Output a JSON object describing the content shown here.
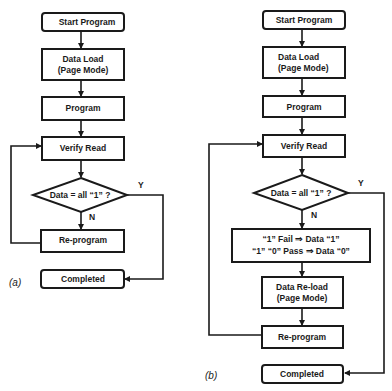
{
  "diagram": {
    "type": "flowchart",
    "panels": [
      {
        "label": "(a)",
        "nodes": {
          "start": "Start Program",
          "data_load_1": "Data Load",
          "data_load_2": "(Page Mode)",
          "program": "Program",
          "verify": "Verify Read",
          "decision": "Data = all “1” ?",
          "reprogram": "Re-program",
          "completed": "Completed"
        },
        "edges": {
          "yes": "Y",
          "no": "N"
        }
      },
      {
        "label": "(b)",
        "nodes": {
          "start": "Start Program",
          "data_load_1": "Data Load",
          "data_load_2": "(Page Mode)",
          "program": "Program",
          "verify": "Verify Read",
          "decision": "Data = all “1” ?",
          "rule_1": "“1” Fail ⇒ Data “1”",
          "rule_2": "“1” “0” Pass ⇒ Data “0”",
          "reload_1": "Data Re-load",
          "reload_2": "(Page Mode)",
          "reprogram": "Re-program",
          "completed": "Completed"
        },
        "edges": {
          "yes": "Y",
          "no": "N"
        }
      }
    ]
  }
}
